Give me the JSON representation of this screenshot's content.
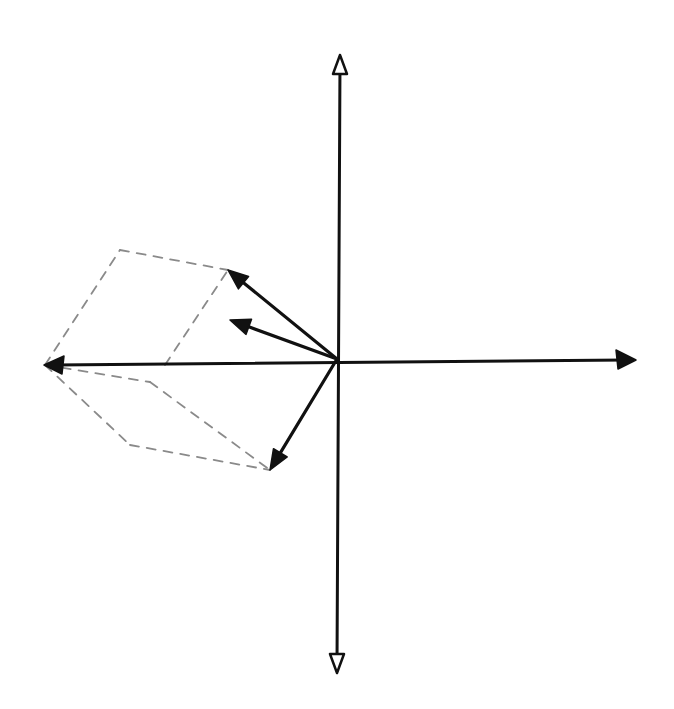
{
  "diagram": {
    "type": "hand-drawn vector addition sketch",
    "background": "#ffffff",
    "ink_color": "#111111",
    "construction_color": "#8a8a8a",
    "origin": [
      337,
      359
    ],
    "axes": {
      "up": {
        "tip": [
          340,
          55
        ]
      },
      "down": {
        "tip": [
          337,
          672
        ]
      },
      "left": {
        "tip": [
          45,
          365
        ]
      },
      "right": {
        "tip": [
          635,
          360
        ]
      }
    },
    "vectors": [
      {
        "id": "vector-upper-left-long",
        "from": [
          337,
          359
        ],
        "to": [
          228,
          270
        ]
      },
      {
        "id": "vector-upper-left-short",
        "from": [
          337,
          359
        ],
        "to": [
          230,
          320
        ]
      },
      {
        "id": "vector-lower-left",
        "from": [
          337,
          359
        ],
        "to": [
          270,
          470
        ]
      }
    ],
    "dashed_construction_lines": [
      {
        "from": [
          45,
          365
        ],
        "to": [
          120,
          250
        ]
      },
      {
        "from": [
          120,
          250
        ],
        "to": [
          228,
          270
        ]
      },
      {
        "from": [
          165,
          365
        ],
        "to": [
          228,
          270
        ]
      },
      {
        "from": [
          45,
          365
        ],
        "to": [
          150,
          382
        ]
      },
      {
        "from": [
          150,
          382
        ],
        "to": [
          270,
          470
        ]
      },
      {
        "from": [
          45,
          365
        ],
        "to": [
          130,
          445
        ]
      },
      {
        "from": [
          130,
          445
        ],
        "to": [
          270,
          470
        ]
      }
    ],
    "labels": []
  }
}
